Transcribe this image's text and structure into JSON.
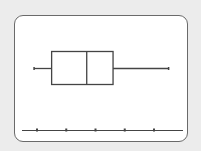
{
  "chart_data": {
    "type": "boxplot",
    "title": "",
    "xlabel": "",
    "ylabel": "",
    "orientation": "horizontal",
    "axis": {
      "ticks": [
        1,
        2,
        3,
        4,
        5
      ],
      "tick_labels": [],
      "xlim": [
        0.5,
        6.0
      ],
      "grid": false
    },
    "series": [
      {
        "name": "",
        "min": 0.9,
        "q1": 1.5,
        "median": 2.7,
        "q3": 3.6,
        "max": 5.5
      }
    ]
  },
  "colors": {
    "background": "#ececec",
    "screen": "#ffffff",
    "line": "#444444",
    "frame": "#6a6a6a"
  }
}
